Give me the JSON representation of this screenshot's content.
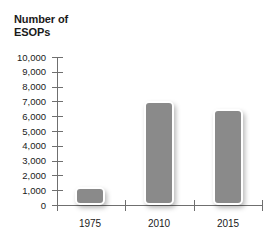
{
  "chart_data": {
    "type": "bar",
    "title": "Number of ESOPs",
    "title_line1": "Number of",
    "title_line2": "ESOPs",
    "xlabel": "",
    "ylabel": "Number of ESOPs",
    "categories": [
      "1975",
      "2010",
      "2015"
    ],
    "values": [
      1200,
      7000,
      6500
    ],
    "ylim": [
      0,
      10000
    ],
    "ytick_values": [
      10000,
      9000,
      8000,
      7000,
      6000,
      5000,
      4000,
      3000,
      2000,
      1000,
      0
    ],
    "ytick_labels": [
      "10,000",
      "9,000",
      "8,000",
      "7,000",
      "6,000",
      "5,000",
      "4,000",
      "3,000",
      "2,000",
      "1,000",
      "0"
    ],
    "grid": false,
    "legend": null,
    "series": [
      {
        "name": "Number of ESOPs",
        "values": [
          1200,
          7000,
          6500
        ],
        "color": "#8a8a8a"
      }
    ],
    "colors": {
      "bar_fill": "#8a8a8a",
      "bar_outline": "#ffffff",
      "axis": "#6f6f6f",
      "text": "#1a1a1a",
      "background": "#ffffff"
    }
  }
}
